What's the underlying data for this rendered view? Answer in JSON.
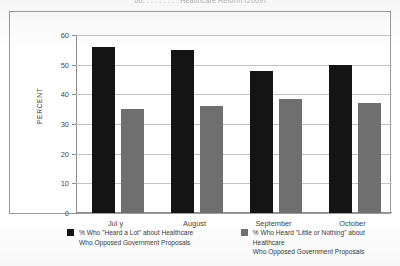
{
  "figure": {
    "title_clipped": "pp. . . . . . . . . Healthcare Reform (2009)",
    "frame_border_color": "#9b9b9b"
  },
  "chart_data": {
    "type": "bar",
    "title": "",
    "xlabel": "",
    "ylabel": "PERCENT",
    "ylim": [
      0,
      60
    ],
    "ytick_step": 10,
    "yticks": [
      "0",
      "10",
      "20",
      "30",
      "40",
      "50",
      "60"
    ],
    "grid": true,
    "legend_position": "bottom",
    "categories": [
      "Jul y",
      "August",
      "September",
      "October"
    ],
    "series": [
      {
        "name": "% Who \"Heard a Lot\" about Healthcare Who Opposed Government Proposals",
        "legend_line1": "% Who \"Heard a Lot\" about Healthcare",
        "legend_line2": "Who Opposed Government Proposals",
        "color": "#141414",
        "values": [
          56,
          55,
          48,
          50
        ]
      },
      {
        "name": "% Who Heard \"Little or Nothing\" about Healthcare Who Opposed Government Proposals",
        "legend_line1": "% Who Heard \"Little or Nothing\" about Healthcare",
        "legend_line2": "Who Opposed Government Proposals",
        "color": "#6f6f6f",
        "values": [
          35,
          36,
          38.5,
          37
        ]
      }
    ]
  }
}
